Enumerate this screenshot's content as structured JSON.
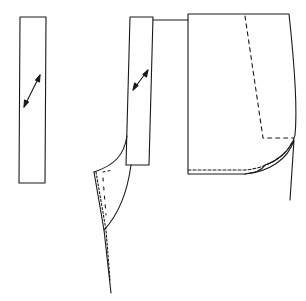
{
  "diagram": {
    "type": "sewing-pattern",
    "colors": {
      "line": "#1a1a1a",
      "background": "#ffffff"
    },
    "pieces": [
      {
        "id": "strip-left",
        "label": "",
        "grainline": "diagonal-double-arrow"
      },
      {
        "id": "strip-middle",
        "label": "",
        "grainline": "diagonal-double-arrow"
      },
      {
        "id": "pocket-panel",
        "label": "",
        "grainline": ""
      },
      {
        "id": "front-edge-curve",
        "label": "",
        "grainline": ""
      }
    ]
  }
}
